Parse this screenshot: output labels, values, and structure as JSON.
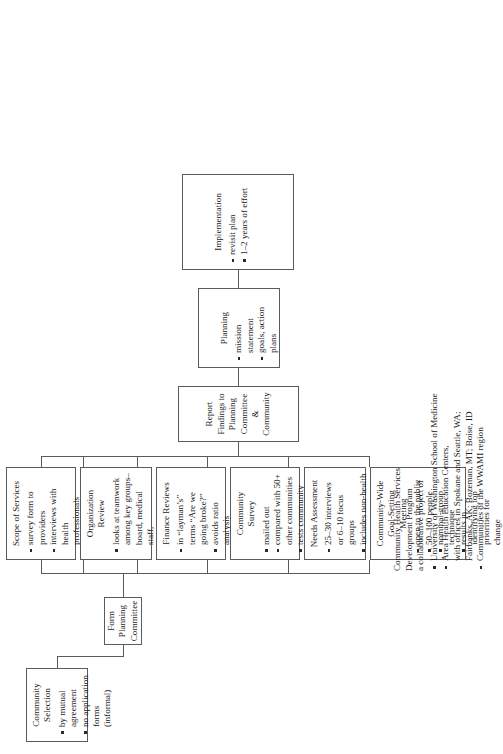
{
  "document": {
    "type": "flowchart",
    "orientation": "rotated-90-ccw",
    "caption": {
      "line1": "Community Health Services",
      "line2": "Development Program",
      "line3": "a collaborative project of",
      "bullets": [
        "University of Washington School of Medicine",
        "Area Health Education Centers,\nwith offices in Spokane and Seattle, WA;\nFairbanks, AK; Bozeman, MT; Boise, ID",
        "Communities of the WWAMI region"
      ]
    }
  },
  "boxes": {
    "community_selection": {
      "title": "Community Selection",
      "bullets": [
        "by mutual agreement",
        "no application forms (informal)"
      ]
    },
    "form_planning_committee": {
      "title": "Form Planning Committee",
      "bullets": []
    },
    "community_wide_goal_setting_meeting": {
      "title": "Community-Wide\nGoal-Setting\nMeeting",
      "bullets": [
        "open to the public",
        "50–100 people",
        "nominal-group technique",
        "results in identifying top priorities for change"
      ]
    },
    "needs_assessment": {
      "title": "Needs Assessment",
      "bullets": [
        "25–30 interviews or 6–10 focus groups",
        "includes non-health care informants",
        "in-depth discussion"
      ]
    },
    "community_survey": {
      "title": "Community\nSurvey",
      "bullets": [
        "mailed out",
        "compared with 50+ other communities",
        "tests community attitudes about health care"
      ]
    },
    "finance_reviews": {
      "title": "Finance Reviews",
      "bullets": [
        "in “layman’s” terms “Are we going broke?”",
        "avoids ratio analysis",
        "recommendations for change"
      ]
    },
    "organization_review": {
      "title": "Organization\nReview",
      "bullets": [
        "looks at teamwork among key groups–board, medical staff, administration",
        "employee meetings and survey",
        "interviews"
      ]
    },
    "scope_of_services": {
      "title": "Scope of Services",
      "bullets": [
        "survey form to providers",
        "interviews with health professionals",
        "assesses recruit-ment needs",
        "makes recomend-ations"
      ]
    },
    "report_findings": {
      "title": "Report Findings to Planning Committee &\nCommunity",
      "bullets": []
    },
    "planning": {
      "title": "Planning",
      "bullets": [
        "mission statement",
        "goals, action plans"
      ]
    },
    "implementation": {
      "title": "Implementation",
      "bullets": [
        "revisit plan",
        "1–2 years of effort"
      ]
    }
  },
  "colors": {
    "stroke": "#5b5b5b",
    "text": "#1a1a1a",
    "background": "#ffffff"
  }
}
